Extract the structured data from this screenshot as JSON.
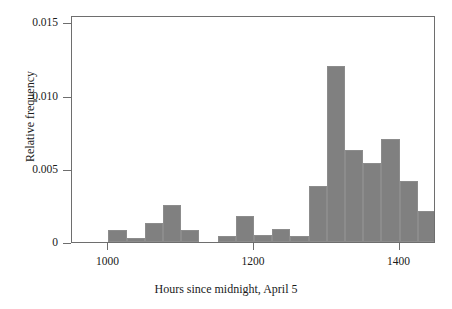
{
  "chart_data": {
    "type": "bar",
    "title": "",
    "subtitle": "",
    "xlabel": "Hours since midnight, April 5",
    "ylabel": "Relative frequency",
    "xlim": [
      950,
      1450
    ],
    "ylim": [
      0,
      0.0155
    ],
    "grid": false,
    "legend": null,
    "bin_width": 25,
    "xticks": [
      {
        "value": 1000,
        "label": "1000"
      },
      {
        "value": 1200,
        "label": "1200"
      },
      {
        "value": 1400,
        "label": "1400"
      }
    ],
    "yticks": [
      {
        "value": 0,
        "label": "0"
      },
      {
        "value": 0.005,
        "label": "0.005"
      },
      {
        "value": 0.01,
        "label": "0.010"
      },
      {
        "value": 0.015,
        "label": "0.015"
      }
    ],
    "bars": [
      {
        "bin_start": 1000,
        "bin_end": 1025,
        "value": 0.0008
      },
      {
        "bin_start": 1025,
        "bin_end": 1050,
        "value": 0.0003
      },
      {
        "bin_start": 1050,
        "bin_end": 1075,
        "value": 0.0013
      },
      {
        "bin_start": 1075,
        "bin_end": 1100,
        "value": 0.0025
      },
      {
        "bin_start": 1100,
        "bin_end": 1125,
        "value": 0.0008
      },
      {
        "bin_start": 1150,
        "bin_end": 1175,
        "value": 0.0004
      },
      {
        "bin_start": 1175,
        "bin_end": 1200,
        "value": 0.0018
      },
      {
        "bin_start": 1200,
        "bin_end": 1225,
        "value": 0.0005
      },
      {
        "bin_start": 1225,
        "bin_end": 1250,
        "value": 0.0009
      },
      {
        "bin_start": 1250,
        "bin_end": 1275,
        "value": 0.0004
      },
      {
        "bin_start": 1275,
        "bin_end": 1300,
        "value": 0.0038
      },
      {
        "bin_start": 1300,
        "bin_end": 1325,
        "value": 0.012
      },
      {
        "bin_start": 1325,
        "bin_end": 1350,
        "value": 0.0063
      },
      {
        "bin_start": 1350,
        "bin_end": 1375,
        "value": 0.0054
      },
      {
        "bin_start": 1375,
        "bin_end": 1400,
        "value": 0.007
      },
      {
        "bin_start": 1400,
        "bin_end": 1425,
        "value": 0.0042
      },
      {
        "bin_start": 1425,
        "bin_end": 1450,
        "value": 0.0021
      }
    ],
    "categories": [
      "1000-1025",
      "1025-1050",
      "1050-1075",
      "1075-1100",
      "1100-1125",
      "1150-1175",
      "1175-1200",
      "1200-1225",
      "1225-1250",
      "1250-1275",
      "1275-1300",
      "1300-1325",
      "1325-1350",
      "1350-1375",
      "1375-1400",
      "1400-1425",
      "1425-1450"
    ],
    "values": [
      0.0008,
      0.0003,
      0.0013,
      0.0025,
      0.0008,
      0.0004,
      0.0018,
      0.0005,
      0.0009,
      0.0004,
      0.0038,
      0.012,
      0.0063,
      0.0054,
      0.007,
      0.0042,
      0.0021
    ],
    "bar_color": "#808080",
    "frame_color": "#6e6e6e"
  }
}
